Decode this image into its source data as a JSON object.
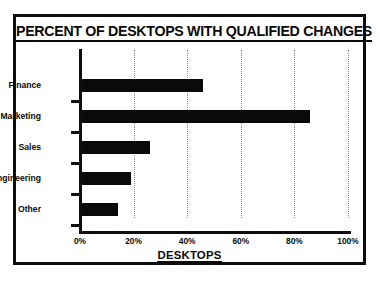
{
  "chart_data": {
    "type": "bar",
    "orientation": "horizontal",
    "title": "PERCENT OF DESKTOPS WITH QUALIFIED CHANGES",
    "xlabel": "DESKTOPS",
    "ylabel": "",
    "categories": [
      "Finance",
      "Marketing",
      "Sales",
      "Engineering",
      "Other"
    ],
    "values": [
      46,
      86,
      26,
      19,
      14
    ],
    "xlim": [
      0,
      100
    ],
    "xticks": [
      0,
      20,
      40,
      60,
      80,
      100
    ],
    "xtick_labels": [
      "0%",
      "20%",
      "40%",
      "60%",
      "80%",
      "100%"
    ],
    "grid": true,
    "grid_axis": "x",
    "grid_style": "dotted",
    "legend": false,
    "bar_color": "#0a0a0a",
    "frame_color": "#0d0d0d",
    "background": "#ffffff"
  }
}
